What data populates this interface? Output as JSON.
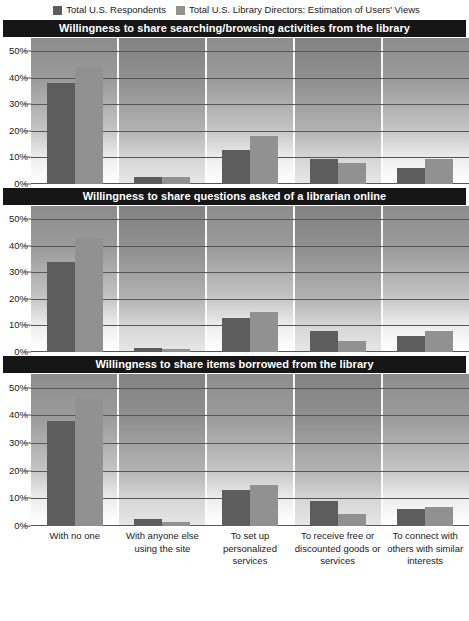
{
  "legend": {
    "items": [
      {
        "label": "Total U.S. Respondents",
        "color": "#5d5d5d",
        "icon": "square-swatch-icon"
      },
      {
        "label": "Total U.S. Library Directors: Estimation of Users' Views",
        "color": "#919191",
        "icon": "square-swatch-icon"
      }
    ]
  },
  "axis": {
    "yticks": [
      "0%",
      "10%",
      "20%",
      "30%",
      "40%",
      "50%"
    ],
    "xlabels": [
      "With no one",
      "With anyone else using the site",
      "To set up personalized services",
      "To receive free or discounted goods or services",
      "To connect with others with similar interests"
    ]
  },
  "panels": [
    {
      "title": "Willingness to share searching/browsing activities from the library"
    },
    {
      "title": "Willingness to share questions asked of a librarian online"
    },
    {
      "title": "Willingness to share items borrowed from the library"
    }
  ],
  "chart_data": [
    {
      "type": "bar",
      "title": "Willingness to share searching/browsing activities from the library",
      "xlabel": "",
      "ylabel": "",
      "ylim": [
        0,
        55
      ],
      "yticks": [
        0,
        10,
        20,
        30,
        40,
        50
      ],
      "grid": true,
      "legend_position": "top",
      "categories": [
        "With no one",
        "With anyone else using the site",
        "To set up personalized services",
        "To receive free or discounted goods or services",
        "To connect with others with similar interests"
      ],
      "series": [
        {
          "name": "Total U.S. Respondents",
          "color": "#5d5d5d",
          "values": [
            38,
            2.5,
            13,
            9.5,
            6
          ]
        },
        {
          "name": "Total U.S. Library Directors: Estimation of Users' Views",
          "color": "#919191",
          "values": [
            44,
            2.5,
            18,
            8,
            9.5
          ]
        }
      ]
    },
    {
      "type": "bar",
      "title": "Willingness to share questions asked of a librarian online",
      "xlabel": "",
      "ylabel": "",
      "ylim": [
        0,
        55
      ],
      "yticks": [
        0,
        10,
        20,
        30,
        40,
        50
      ],
      "grid": true,
      "legend_position": "top",
      "categories": [
        "With no one",
        "With anyone else using the site",
        "To set up personalized services",
        "To receive free or discounted goods or services",
        "To connect with others with similar interests"
      ],
      "series": [
        {
          "name": "Total U.S. Respondents",
          "color": "#5d5d5d",
          "values": [
            34,
            1.5,
            13,
            8,
            6
          ]
        },
        {
          "name": "Total U.S. Library Directors: Estimation of Users' Views",
          "color": "#919191",
          "values": [
            43,
            1,
            15,
            4,
            8
          ]
        }
      ]
    },
    {
      "type": "bar",
      "title": "Willingness to share items borrowed from the library",
      "xlabel": "",
      "ylabel": "",
      "ylim": [
        0,
        55
      ],
      "yticks": [
        0,
        10,
        20,
        30,
        40,
        50
      ],
      "grid": true,
      "legend_position": "top",
      "categories": [
        "With no one",
        "With anyone else using the site",
        "To set up personalized services",
        "To receive free or discounted goods or services",
        "To connect with others with similar interests"
      ],
      "series": [
        {
          "name": "Total U.S. Respondents",
          "color": "#5d5d5d",
          "values": [
            38,
            2.5,
            13,
            9,
            6
          ]
        },
        {
          "name": "Total U.S. Library Directors: Estimation of Users' Views",
          "color": "#919191",
          "values": [
            46.5,
            1.5,
            15,
            4.5,
            7
          ]
        }
      ]
    }
  ]
}
